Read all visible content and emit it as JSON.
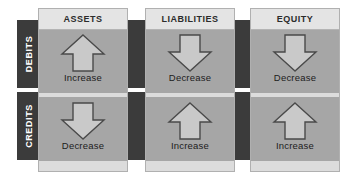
{
  "colors": {
    "page_background": "#ffffff",
    "band_dark": "#3b3b3b",
    "column_panel": "#dcdcdc",
    "column_header": "#e4e4e4",
    "cell_gray": "#a6a6a6",
    "arrow_fill": "#c9c9c9",
    "arrow_outline": "#4a4a4a",
    "label_text": "#1c1c1c",
    "row_label_text": "#ffffff"
  },
  "rows": [
    {
      "key": "debits",
      "label": "DEBITS"
    },
    {
      "key": "credits",
      "label": "CREDITS"
    }
  ],
  "columns": [
    {
      "key": "assets",
      "header": "ASSETS",
      "debit": {
        "direction": "up",
        "label": "Increase",
        "icon": "arrow-up-icon"
      },
      "credit": {
        "direction": "down",
        "label": "Decrease",
        "icon": "arrow-down-icon"
      }
    },
    {
      "key": "liabilities",
      "header": "LIABILITIES",
      "debit": {
        "direction": "down",
        "label": "Decrease",
        "icon": "arrow-down-icon"
      },
      "credit": {
        "direction": "up",
        "label": "Increase",
        "icon": "arrow-up-icon"
      }
    },
    {
      "key": "equity",
      "header": "EQUITY",
      "debit": {
        "direction": "down",
        "label": "Decrease",
        "icon": "arrow-down-icon"
      },
      "credit": {
        "direction": "up",
        "label": "Increase",
        "icon": "arrow-up-icon"
      }
    }
  ]
}
